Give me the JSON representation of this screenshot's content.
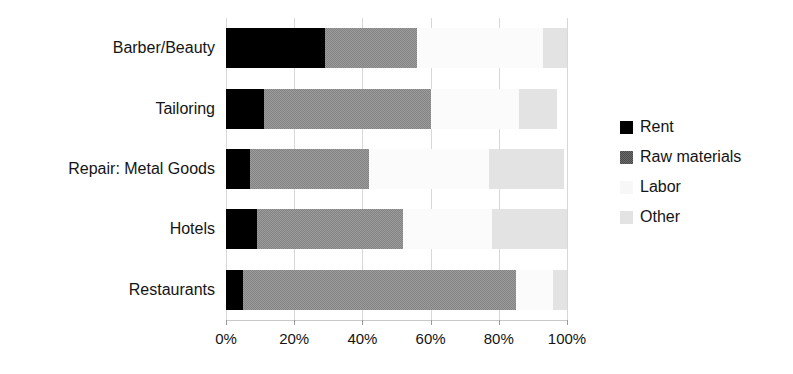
{
  "chart_data": {
    "type": "bar",
    "orientation": "horizontal",
    "stacked": true,
    "title": "",
    "xlabel": "",
    "ylabel": "",
    "xlim": [
      0,
      100
    ],
    "xticks": [
      "0%",
      "20%",
      "40%",
      "60%",
      "80%",
      "100%"
    ],
    "xtick_values": [
      0,
      20,
      40,
      60,
      80,
      100
    ],
    "grid": true,
    "legend_position": "right",
    "categories": [
      "Barber/Beauty",
      "Tailoring",
      "Repair: Metal Goods",
      "Hotels",
      "Restaurants"
    ],
    "series": [
      {
        "name": "Rent",
        "color": "#000000",
        "values": [
          29,
          11,
          7,
          9,
          5
        ]
      },
      {
        "name": "Raw materials",
        "color": "#9c9c9c",
        "values": [
          27,
          49,
          35,
          43,
          80
        ]
      },
      {
        "name": "Labor",
        "color": "#fbfbfb",
        "values": [
          37,
          26,
          35,
          26,
          11
        ]
      },
      {
        "name": "Other",
        "color": "#e3e3e3",
        "values": [
          7,
          11,
          22,
          22,
          4
        ]
      }
    ]
  },
  "legend": {
    "items": [
      {
        "label": "Rent",
        "swatch": "rent"
      },
      {
        "label": "Raw materials",
        "swatch": "raw"
      },
      {
        "label": "Labor",
        "swatch": "labor"
      },
      {
        "label": "Other",
        "swatch": "other"
      }
    ]
  }
}
